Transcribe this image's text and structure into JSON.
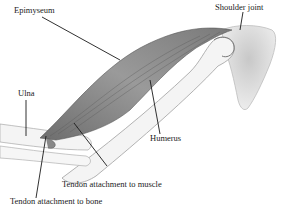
{
  "diagram": {
    "type": "anatomical-illustration",
    "labels": [
      {
        "id": "epimyseum",
        "text": "Epimyseum"
      },
      {
        "id": "shoulder_joint",
        "text": "Shoulder joint"
      },
      {
        "id": "ulna",
        "text": "Ulna"
      },
      {
        "id": "humerus",
        "text": "Humerus"
      },
      {
        "id": "tendon_muscle",
        "text": "Tendon attachment to muscle"
      },
      {
        "id": "tendon_bone",
        "text": "Tendon attachment to bone"
      }
    ],
    "colors": {
      "muscle": "#8a8a8a",
      "bone": "#f2f2f2",
      "bone_outline": "#9a9a9a",
      "scapula": "#dcdcdc",
      "leader": "#1a1a1a"
    }
  }
}
